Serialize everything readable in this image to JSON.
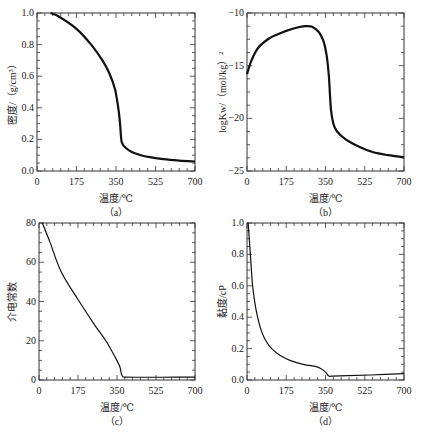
{
  "chart_data": [
    {
      "panel": "a",
      "type": "line",
      "caption": "（a）",
      "xlabel": "温度/℃",
      "ylabel": "密度/（g/cm³）",
      "xlim": [
        0,
        700
      ],
      "ylim": [
        0,
        1.0
      ],
      "xticks": [
        "0",
        "175",
        "350",
        "525",
        "700"
      ],
      "yticks": [
        "0.0",
        "0.2",
        "0.4",
        "0.6",
        "0.8",
        "1.0"
      ],
      "x": [
        60,
        100,
        175,
        240,
        290,
        320,
        345,
        360,
        368,
        372,
        376,
        390,
        420,
        460,
        500,
        560,
        630,
        700
      ],
      "y": [
        1.0,
        0.975,
        0.9,
        0.8,
        0.7,
        0.62,
        0.52,
        0.4,
        0.3,
        0.22,
        0.18,
        0.15,
        0.12,
        0.1,
        0.088,
        0.075,
        0.066,
        0.06
      ]
    },
    {
      "panel": "b",
      "type": "line",
      "caption": "（b）",
      "xlabel": "温度/℃",
      "ylabel": "logKw/（mol/kg）²",
      "xlim": [
        0,
        700
      ],
      "ylim": [
        -25,
        -10
      ],
      "xticks": [
        "0",
        "175",
        "350",
        "525",
        "700"
      ],
      "yticks": [
        "−25",
        "−20",
        "−15",
        "−10"
      ],
      "x": [
        0,
        20,
        50,
        100,
        140,
        175,
        220,
        260,
        290,
        320,
        340,
        355,
        365,
        370,
        375,
        385,
        400,
        440,
        500,
        560,
        630,
        700
      ],
      "y": [
        -15.8,
        -14.5,
        -13.3,
        -12.4,
        -12.0,
        -11.7,
        -11.4,
        -11.25,
        -11.3,
        -11.8,
        -12.6,
        -14.0,
        -16.0,
        -17.8,
        -19.3,
        -20.5,
        -21.2,
        -22.0,
        -22.7,
        -23.2,
        -23.5,
        -23.7
      ]
    },
    {
      "panel": "c",
      "type": "line",
      "caption": "（c）",
      "xlabel": "温度/℃",
      "ylabel": "介电常数",
      "xlim": [
        0,
        700
      ],
      "ylim": [
        0,
        80
      ],
      "xticks": [
        "0",
        "175",
        "350",
        "525",
        "700"
      ],
      "yticks": [
        "0",
        "20",
        "40",
        "60",
        "80"
      ],
      "x": [
        15,
        50,
        100,
        175,
        250,
        300,
        340,
        362,
        370,
        376,
        385,
        450,
        550,
        700
      ],
      "y": [
        80,
        70,
        55,
        41,
        28,
        20,
        12,
        7,
        3,
        1.8,
        1.5,
        1.4,
        1.4,
        1.5
      ]
    },
    {
      "panel": "d",
      "type": "line",
      "caption": "（d）",
      "xlabel": "温度/℃",
      "ylabel": "黏度/cP",
      "xlim": [
        0,
        700
      ],
      "ylim": [
        0,
        1.0
      ],
      "xticks": [
        "0",
        "175",
        "350",
        "525",
        "700"
      ],
      "yticks": [
        "0.0",
        "0.2",
        "0.4",
        "0.6",
        "0.8",
        "1.0"
      ],
      "x": [
        5,
        15,
        25,
        40,
        60,
        80,
        110,
        150,
        200,
        250,
        300,
        330,
        350,
        365,
        380,
        450,
        550,
        700
      ],
      "y": [
        1.0,
        0.8,
        0.6,
        0.45,
        0.33,
        0.26,
        0.2,
        0.155,
        0.12,
        0.1,
        0.088,
        0.072,
        0.05,
        0.025,
        0.025,
        0.028,
        0.032,
        0.04
      ]
    }
  ]
}
